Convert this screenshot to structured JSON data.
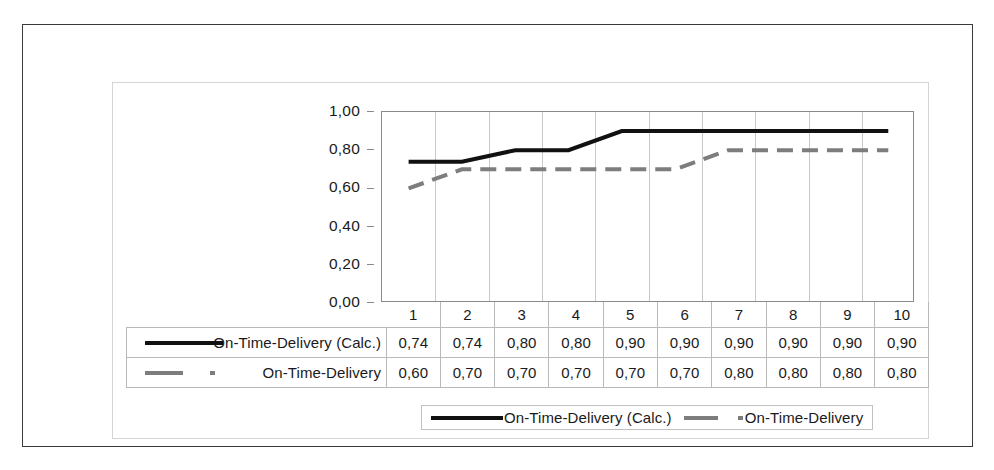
{
  "chart_data": {
    "type": "line",
    "title": "",
    "xlabel": "",
    "ylabel": "",
    "categories": [
      "1",
      "2",
      "3",
      "4",
      "5",
      "6",
      "7",
      "8",
      "9",
      "10"
    ],
    "ylim": [
      0,
      1
    ],
    "ytick_labels": [
      "1,00",
      "0,80",
      "0,60",
      "0,40",
      "0,20",
      "0,00"
    ],
    "ytick_values": [
      1.0,
      0.8,
      0.6,
      0.4,
      0.2,
      0.0
    ],
    "grid": "vertical",
    "legend_position": "bottom",
    "decimal_separator": ",",
    "series": [
      {
        "name": "On-Time-Delivery (Calc.)",
        "style": "solid",
        "color": "#111111",
        "values": [
          0.74,
          0.74,
          0.8,
          0.8,
          0.9,
          0.9,
          0.9,
          0.9,
          0.9,
          0.9
        ],
        "labels": [
          "0,74",
          "0,74",
          "0,80",
          "0,80",
          "0,90",
          "0,90",
          "0,90",
          "0,90",
          "0,90",
          "0,90"
        ]
      },
      {
        "name": "On-Time-Delivery",
        "style": "dashed",
        "color": "#7d7d7d",
        "values": [
          0.6,
          0.7,
          0.7,
          0.7,
          0.7,
          0.7,
          0.8,
          0.8,
          0.8,
          0.8
        ],
        "labels": [
          "0,60",
          "0,70",
          "0,70",
          "0,70",
          "0,70",
          "0,70",
          "0,80",
          "0,80",
          "0,80",
          "0,80"
        ]
      }
    ]
  },
  "legend": {
    "entries": [
      {
        "label": "On-Time-Delivery (Calc.)",
        "style": "solid"
      },
      {
        "label": "On-Time-Delivery",
        "style": "dashed"
      }
    ]
  },
  "data_table": {
    "header": [
      "1",
      "2",
      "3",
      "4",
      "5",
      "6",
      "7",
      "8",
      "9",
      "10"
    ],
    "rows": [
      {
        "label": "On-Time-Delivery (Calc.)",
        "style": "solid",
        "values": [
          "0,74",
          "0,74",
          "0,80",
          "0,80",
          "0,90",
          "0,90",
          "0,90",
          "0,90",
          "0,90",
          "0,90"
        ]
      },
      {
        "label": "On-Time-Delivery",
        "style": "dashed",
        "values": [
          "0,60",
          "0,70",
          "0,70",
          "0,70",
          "0,70",
          "0,70",
          "0,80",
          "0,80",
          "0,80",
          "0,80"
        ]
      }
    ]
  },
  "colors": {
    "series_calc": "#111111",
    "series_actual": "#7d7d7d",
    "grid": "#c8c8c8",
    "axis": "#8a8a8a",
    "outer_frame": "#3a3a3a"
  }
}
